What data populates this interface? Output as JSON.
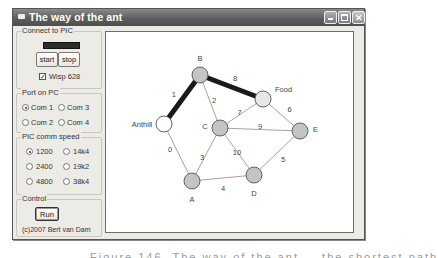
{
  "window": {
    "title": "The way of the ant",
    "controls": {
      "minimize": "minimize",
      "maximize": "maximize",
      "close": "✕"
    }
  },
  "connect_group": {
    "legend": "Connect to PIC",
    "start_label": "start",
    "stop_label": "stop",
    "wisp_label": "Wisp 628",
    "wisp_checked": true
  },
  "port_group": {
    "legend": "Port on PC",
    "options": [
      {
        "label": "Com 1",
        "selected": true
      },
      {
        "label": "Com 3",
        "selected": false
      },
      {
        "label": "Com 2",
        "selected": false
      },
      {
        "label": "Com 4",
        "selected": false
      }
    ]
  },
  "speed_group": {
    "legend": "PIC comm speed",
    "options": [
      {
        "label": "1200",
        "selected": true
      },
      {
        "label": "14k4",
        "selected": false
      },
      {
        "label": "2400",
        "selected": false
      },
      {
        "label": "19k2",
        "selected": false
      },
      {
        "label": "4800",
        "selected": false
      },
      {
        "label": "38k4",
        "selected": false
      }
    ]
  },
  "control_group": {
    "legend": "Control",
    "run_label": "Run",
    "copyright": "(c)2007 Bert van Dam"
  },
  "graph": {
    "nodes": [
      {
        "id": "Anthill",
        "label": "Anthill",
        "x": 164,
        "y": 124,
        "fill": "#ffffff"
      },
      {
        "id": "B",
        "label": "B",
        "x": 200,
        "y": 75,
        "fill": "#c4c4c4"
      },
      {
        "id": "Food",
        "label": "Food",
        "x": 263,
        "y": 99,
        "fill": "#e6e6e6"
      },
      {
        "id": "C",
        "label": "C",
        "x": 220,
        "y": 128,
        "fill": "#c4c4c4"
      },
      {
        "id": "E",
        "label": "E",
        "x": 300,
        "y": 131,
        "fill": "#c4c4c4"
      },
      {
        "id": "D",
        "label": "D",
        "x": 254,
        "y": 175,
        "fill": "#c4c4c4"
      },
      {
        "id": "A",
        "label": "A",
        "x": 192,
        "y": 181,
        "fill": "#c4c4c4"
      }
    ],
    "edges": [
      {
        "from": "Anthill",
        "to": "B",
        "label": "1",
        "bold": true
      },
      {
        "from": "B",
        "to": "Food",
        "label": "8",
        "bold": true
      },
      {
        "from": "B",
        "to": "C",
        "label": "2",
        "bold": false
      },
      {
        "from": "Anthill",
        "to": "A",
        "label": "0",
        "bold": false
      },
      {
        "from": "C",
        "to": "Food",
        "label": "7",
        "bold": false
      },
      {
        "from": "Food",
        "to": "E",
        "label": "6",
        "bold": false
      },
      {
        "from": "C",
        "to": "E",
        "label": "9",
        "bold": false
      },
      {
        "from": "C",
        "to": "D",
        "label": "10",
        "bold": false
      },
      {
        "from": "C",
        "to": "A",
        "label": "3",
        "bold": false
      },
      {
        "from": "A",
        "to": "D",
        "label": "4",
        "bold": false
      },
      {
        "from": "D",
        "to": "E",
        "label": "5",
        "bold": false
      }
    ]
  },
  "caption": "Figure 146. The way of the ant — the shortest path"
}
